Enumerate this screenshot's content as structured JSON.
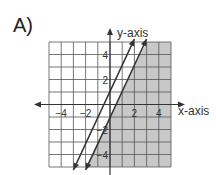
{
  "panel_label": "A)",
  "chart_data": {
    "type": "line",
    "title": "A)",
    "xlabel": "x-axis",
    "ylabel": "y-axis",
    "xlim": [
      -5,
      5
    ],
    "ylim": [
      -5,
      5
    ],
    "grid": true,
    "x_ticks": [
      -4,
      -2,
      2,
      4
    ],
    "y_ticks": [
      4,
      2,
      -2,
      -4
    ],
    "series": [
      {
        "name": "y = 2x + 1",
        "slope": 2,
        "intercept": 1,
        "style": "solid",
        "x": [
          -3,
          2
        ],
        "y": [
          -5,
          5
        ]
      },
      {
        "name": "y = 2x - 1",
        "slope": 2,
        "intercept": -1,
        "style": "solid",
        "x": [
          -2,
          3
        ],
        "y": [
          -5,
          5
        ]
      }
    ],
    "shaded_region": "right of / below y = 2x - 1 (y ≤ 2x - 1)",
    "shade_color": "#c8c8c8"
  }
}
